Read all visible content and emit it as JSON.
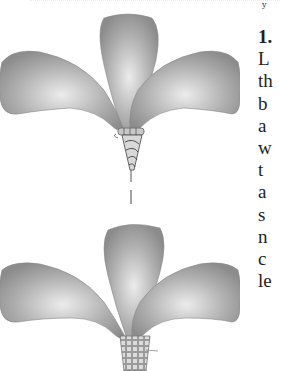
{
  "page": {
    "step_number": "1.",
    "text_fragments": [
      "L",
      "th",
      "b",
      "a",
      "w",
      "t",
      "a",
      "s",
      "n",
      "c",
      "le"
    ],
    "top_fragment": "y"
  },
  "figures": [
    {
      "name": "flower-bundle-tied-stem",
      "description": "Three gray gradient petals gathered and bound with wire at the base"
    },
    {
      "name": "flower-bundle-woven-base",
      "description": "Three gray gradient petals inserted into a woven/taped base"
    }
  ],
  "colors": {
    "petal_dark": "#8a8a8a",
    "petal_light": "#e6e6e6",
    "text": "#1e1e1e",
    "background": "#ffffff"
  }
}
